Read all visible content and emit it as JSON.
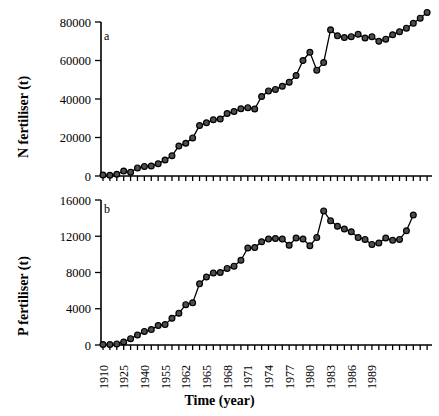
{
  "figure": {
    "xlabel": "Time (year)",
    "panel_a_letter": "a",
    "panel_b_letter": "b"
  },
  "chart_data": [
    {
      "type": "line",
      "panel": "a",
      "title": "",
      "xlabel": "Time (year)",
      "ylabel": "N fertiliser (t)",
      "ylim": [
        0,
        80000
      ],
      "yticks": [
        0,
        20000,
        40000,
        60000,
        80000
      ],
      "ytick_labels": [
        "0",
        "20000",
        "40000",
        "60000",
        "80000"
      ],
      "grid": false,
      "legend": "none",
      "axis_type": "categorical-index",
      "x": [
        "1910",
        "1925",
        "1940",
        "1955",
        "1956",
        "1957",
        "1958",
        "1959",
        "1960",
        "1961",
        "1962",
        "1963",
        "1964",
        "1965",
        "1966",
        "1967",
        "1968",
        "1969",
        "1970",
        "1971",
        "1972",
        "1973",
        "1974",
        "1975",
        "1976",
        "1977",
        "1978",
        "1979",
        "1980",
        "1981",
        "1982",
        "1983",
        "1984",
        "1985",
        "1986",
        "1987",
        "1988",
        "1989",
        "1990",
        "1991",
        "1992",
        "1993",
        "1994",
        "1995",
        "1996",
        "1997",
        "1998",
        "1999"
      ],
      "xtick_labels": [
        "1910",
        "1925",
        "1940",
        "1955",
        "1962",
        "1965",
        "1968",
        "1971",
        "1974",
        "1977",
        "1980",
        "1983",
        "1986",
        "1989"
      ],
      "xtick_label_indices": [
        0,
        3,
        6,
        9,
        12,
        15,
        18,
        21,
        24,
        27,
        30,
        33,
        36,
        39
      ],
      "values": [
        500,
        400,
        900,
        2600,
        2000,
        4200,
        5000,
        5200,
        6400,
        8300,
        10500,
        15600,
        17000,
        19800,
        26200,
        27600,
        29200,
        29600,
        32500,
        33500,
        34900,
        35500,
        34800,
        41300,
        44200,
        45000,
        46600,
        48700,
        52200,
        60000,
        64300,
        55000,
        58900,
        76000,
        72800,
        71900,
        72400,
        73600,
        71700,
        72300,
        70000,
        71100,
        73400,
        75000,
        76800,
        79300,
        82000,
        85000
      ]
    },
    {
      "type": "line",
      "panel": "b",
      "title": "",
      "xlabel": "Time (year)",
      "ylabel": "P fertiliser (t)",
      "ylim": [
        0,
        16000
      ],
      "yticks": [
        0,
        4000,
        8000,
        12000,
        16000
      ],
      "ytick_labels": [
        "0",
        "4000",
        "8000",
        "12000",
        "16000"
      ],
      "grid": false,
      "legend": "none",
      "axis_type": "categorical-index",
      "x": [
        "1910",
        "1925",
        "1940",
        "1955",
        "1956",
        "1957",
        "1958",
        "1959",
        "1960",
        "1961",
        "1962",
        "1963",
        "1964",
        "1965",
        "1966",
        "1967",
        "1968",
        "1969",
        "1970",
        "1971",
        "1972",
        "1973",
        "1974",
        "1975",
        "1976",
        "1977",
        "1978",
        "1979",
        "1980",
        "1981",
        "1982",
        "1983",
        "1984",
        "1985",
        "1986",
        "1987",
        "1988",
        "1989",
        "1990",
        "1991",
        "1992",
        "1993",
        "1994",
        "1995",
        "1996",
        "1997",
        "1998",
        "1999"
      ],
      "xtick_labels": [
        "1910",
        "1925",
        "1940",
        "1955",
        "1962",
        "1965",
        "1968",
        "1971",
        "1974",
        "1977",
        "1980",
        "1983",
        "1986",
        "1989"
      ],
      "xtick_label_indices": [
        0,
        3,
        6,
        9,
        12,
        15,
        18,
        21,
        24,
        27,
        30,
        33,
        36,
        39
      ],
      "values": [
        60,
        50,
        120,
        330,
        700,
        1100,
        1500,
        1700,
        2150,
        2250,
        2950,
        3500,
        4450,
        4650,
        6750,
        7500,
        7950,
        8000,
        8450,
        8700,
        9350,
        10700,
        10750,
        11400,
        11700,
        11750,
        11700,
        11000,
        11800,
        11700,
        10950,
        11850,
        14800,
        13700,
        13100,
        12800,
        12500,
        11850,
        11650,
        11100,
        11250,
        11800,
        11550,
        11650,
        12600,
        14350
      ]
    }
  ]
}
